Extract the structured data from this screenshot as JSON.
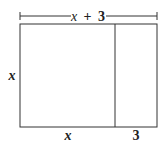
{
  "diagram": {
    "type": "area-model-rectangle",
    "top_label": "x + 3",
    "top_label_parts": {
      "var": "x",
      "op": "+",
      "num": "3"
    },
    "left_label": "x",
    "bottom_left_label": "x",
    "bottom_right_label": "3",
    "colors": {
      "stroke": "#333333",
      "text": "#222222",
      "background": "#ffffff"
    }
  }
}
